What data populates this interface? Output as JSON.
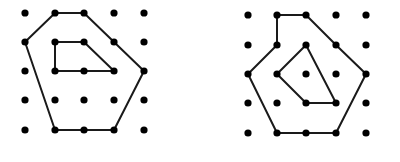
{
  "colors": {
    "dot": "#000000",
    "line": "#1a1a1a",
    "background": "#ffffff"
  },
  "figures": [
    {
      "name": "left-dot-grid-figure",
      "grid": {
        "cols": 5,
        "rows": 5,
        "x": [
          25,
          55,
          84,
          114,
          144
        ],
        "y": [
          13,
          42,
          71,
          100,
          130
        ]
      },
      "polylines": [
        {
          "name": "outer-polygon",
          "points": [
            [
              1,
              0
            ],
            [
              2,
              0
            ],
            [
              4,
              2
            ],
            [
              3,
              4
            ],
            [
              2,
              4
            ],
            [
              1,
              4
            ],
            [
              0,
              1
            ],
            [
              1,
              0
            ]
          ]
        },
        {
          "name": "inner-polygon",
          "points": [
            [
              1,
              1
            ],
            [
              2,
              1
            ],
            [
              3,
              2
            ],
            [
              2,
              2
            ],
            [
              1,
              2
            ],
            [
              1,
              1
            ]
          ]
        }
      ]
    },
    {
      "name": "right-dot-grid-figure",
      "grid": {
        "cols": 5,
        "rows": 5,
        "x": [
          248,
          277,
          306,
          336,
          366
        ],
        "y": [
          15,
          45,
          74,
          103,
          133
        ]
      },
      "polylines": [
        {
          "name": "outer-path",
          "points": [
            [
              1,
              0
            ],
            [
              2,
              0
            ],
            [
              3,
              1
            ],
            [
              4,
              2
            ],
            [
              3,
              4
            ],
            [
              2,
              4
            ],
            [
              1,
              4
            ],
            [
              0,
              2
            ],
            [
              1,
              1
            ],
            [
              1,
              0
            ]
          ]
        },
        {
          "name": "inner-polygon",
          "points": [
            [
              2,
              1
            ],
            [
              3,
              3
            ],
            [
              2,
              3
            ],
            [
              1,
              2
            ],
            [
              2,
              1
            ]
          ]
        }
      ]
    }
  ]
}
